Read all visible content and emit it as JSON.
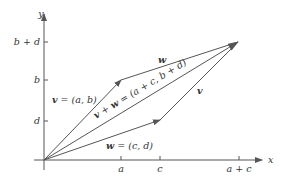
{
  "diagram": {
    "colors": {
      "line": "#555555",
      "text": "#333333",
      "background": "#ffffff"
    },
    "axes": {
      "x_label": "x",
      "y_label": "y",
      "x_ticks": [
        {
          "label": "a",
          "px": 121
        },
        {
          "label": "c",
          "px": 160
        },
        {
          "label": "a + c",
          "px": 239
        }
      ],
      "y_ticks": [
        {
          "label": "b + d",
          "py": 42
        },
        {
          "label": "b",
          "py": 80
        },
        {
          "label": "d",
          "py": 121
        }
      ]
    },
    "points": {
      "origin": [
        44,
        160
      ],
      "v_end": [
        121,
        80
      ],
      "w_end": [
        160,
        120
      ],
      "sum_end": [
        238,
        42
      ]
    },
    "labels": {
      "v_eq_bold": "v",
      "v_eq_rest": " = (a, b)",
      "w_eq_bold": "w",
      "w_eq_rest": " = (c, d)",
      "sum_bold_v": "v",
      "sum_plus": " + ",
      "sum_bold_w": "w",
      "sum_rest": " = (a + c, b + d)",
      "w_top": "w",
      "v_right": "v"
    }
  }
}
